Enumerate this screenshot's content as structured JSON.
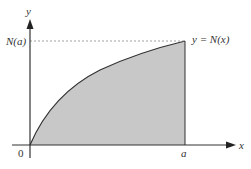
{
  "diagram": {
    "labels": {
      "y_axis": "y",
      "x_axis": "x",
      "origin": "0",
      "x_mark": "a",
      "y_mark": "N(a)",
      "curve": "y = N(x)"
    },
    "colors": {
      "fill": "#c8c8c8",
      "curve": "#333333",
      "axis": "#333333",
      "dashed": "#888888"
    }
  }
}
